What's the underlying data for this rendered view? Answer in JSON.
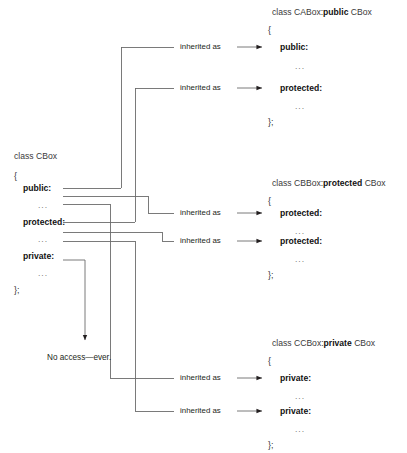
{
  "diagram": {
    "edge_label": "inherited as",
    "note": "No access—ever.",
    "line_color": "#6b6b6b",
    "text_color": "#231f20"
  },
  "base_class": {
    "header_prefix": "class ",
    "header_name": "CBox",
    "open_brace": "{",
    "close_brace": "};",
    "members": [
      {
        "label": "public:",
        "ellipsis": "..."
      },
      {
        "label": "protected:",
        "ellipsis": "..."
      },
      {
        "label": "private:",
        "ellipsis": "..."
      }
    ]
  },
  "derived_classes": [
    {
      "header_prefix": "class ",
      "header_name": "CABox:",
      "header_specifier": "public",
      "header_base": " CBox",
      "open_brace": "{",
      "close_brace": "};",
      "members": [
        {
          "label": "public:",
          "ellipsis": "..."
        },
        {
          "label": "protected:",
          "ellipsis": "..."
        }
      ]
    },
    {
      "header_prefix": "class ",
      "header_name": "CBBox:",
      "header_specifier": "protected",
      "header_base": " CBox",
      "open_brace": "{",
      "close_brace": "};",
      "members": [
        {
          "label": "protected:",
          "ellipsis": "..."
        },
        {
          "label": "protected:",
          "ellipsis": "..."
        }
      ]
    },
    {
      "header_prefix": "class ",
      "header_name": "CCBox:",
      "header_specifier": "private",
      "header_base": " CBox",
      "open_brace": "{",
      "close_brace": "};",
      "members": [
        {
          "label": "private:",
          "ellipsis": "..."
        },
        {
          "label": "private:",
          "ellipsis": "..."
        }
      ]
    }
  ],
  "edges": [
    {
      "label": "inherited as"
    },
    {
      "label": "inherited as"
    },
    {
      "label": "inherited as"
    },
    {
      "label": "inherited as"
    },
    {
      "label": "inherited as"
    },
    {
      "label": "inherited as"
    }
  ]
}
